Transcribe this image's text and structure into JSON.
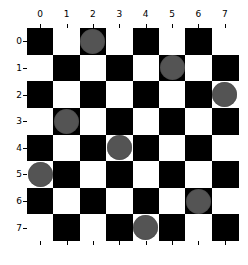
{
  "chart_data": {
    "type": "heatmap",
    "title": "",
    "rows": 8,
    "cols": 8,
    "x_tick_labels": [
      "0",
      "1",
      "2",
      "3",
      "4",
      "5",
      "6",
      "7"
    ],
    "y_tick_labels": [
      "0",
      "1",
      "2",
      "3",
      "4",
      "5",
      "6",
      "7"
    ],
    "x_axis_position": "top",
    "cell_colors": {
      "even": "#000000",
      "odd": "#ffffff"
    },
    "piece_color": "#545454",
    "pieces": [
      {
        "row": 0,
        "col": 2
      },
      {
        "row": 1,
        "col": 5
      },
      {
        "row": 2,
        "col": 7
      },
      {
        "row": 3,
        "col": 1
      },
      {
        "row": 4,
        "col": 3
      },
      {
        "row": 5,
        "col": 0
      },
      {
        "row": 6,
        "col": 6
      },
      {
        "row": 7,
        "col": 4
      }
    ],
    "xlabel": "",
    "ylabel": "",
    "grid": false
  }
}
